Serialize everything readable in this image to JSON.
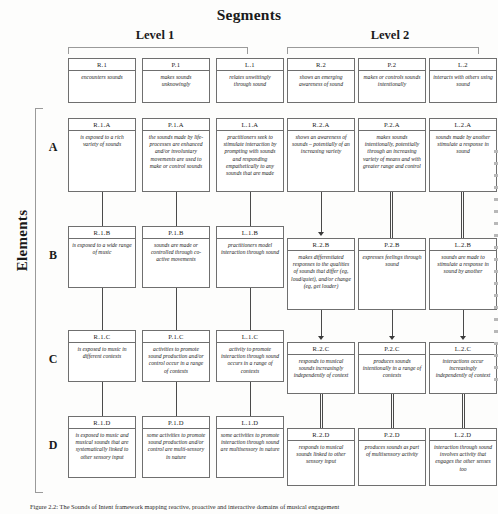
{
  "titles": {
    "segments": "Segments",
    "level1": "Level 1",
    "level2": "Level 2",
    "elements": "Elements"
  },
  "caption": "Figure 2.2: The Sounds of Intent framework mapping reactive, proactive and interactive domains of musical engagement",
  "row_letters": [
    "A",
    "B",
    "C",
    "D"
  ],
  "header_boxes": [
    {
      "code": "R.1",
      "text": "encounters sounds"
    },
    {
      "code": "P.1",
      "text": "makes sounds unknowingly"
    },
    {
      "code": "L.1",
      "text": "relates unwittingly through sound"
    },
    {
      "code": "R.2",
      "text": "shows an emerging awareness of sound"
    },
    {
      "code": "P.2",
      "text": "makes or controls sounds intentionally"
    },
    {
      "code": "L.2",
      "text": "interacts with others using sound"
    }
  ],
  "cells": {
    "A": [
      {
        "code": "R.1.A",
        "text": "is exposed to a rich variety of sounds"
      },
      {
        "code": "P.1.A",
        "text": "the sounds made by life-processes are enhanced and/or involuntary movements are used to make or control sounds"
      },
      {
        "code": "L.1.A",
        "text": "practitioners seek to stimulate interaction by prompting with sounds and responding empathetically to any sounds that are made"
      },
      {
        "code": "R.2.A",
        "text": "shows an awareness of sounds – potentially of an increasing variety"
      },
      {
        "code": "P.2.A",
        "text": "makes sounds intentionally, potentially through an increasing variety of means and with greater range and control"
      },
      {
        "code": "L.2.A",
        "text": "sounds made by another stimulate a response in sound"
      }
    ],
    "B": [
      {
        "code": "R.1.B",
        "text": "is exposed to a wide range of music"
      },
      {
        "code": "P.1.B",
        "text": "sounds are made or controlled through co-active movements"
      },
      {
        "code": "L.1.B",
        "text": "practitioners model interaction through sound"
      },
      {
        "code": "R.2.B",
        "text": "makes differentiated responses to the qualities of sounds that differ (eg, loud/quiet), and/or change (eg, get louder)"
      },
      {
        "code": "P.2.B",
        "text": "expresses feelings through sound"
      },
      {
        "code": "L.2.B",
        "text": "sounds are made to stimulate a response in sound by another"
      }
    ],
    "C": [
      {
        "code": "R.1.C",
        "text": "is exposed to music in different contexts"
      },
      {
        "code": "P.1.C",
        "text": "activities to promote sound production and/or control occur in a range of contexts"
      },
      {
        "code": "L.1.C",
        "text": "activity to promote interaction through sound occurs in a range of contexts"
      },
      {
        "code": "R.2.C",
        "text": "responds to musical sounds increasingly independently of context"
      },
      {
        "code": "P.2.C",
        "text": "produces sounds intentionally in a range of contexts"
      },
      {
        "code": "L.2.C",
        "text": "interactions occur increasingly independently of context"
      }
    ],
    "D": [
      {
        "code": "R.1.D",
        "text": "is exposed to music and musical sounds that are systematically linked to other sensory input"
      },
      {
        "code": "P.1.D",
        "text": "some activities to promote sound production and/or control are multi-sensory in nature"
      },
      {
        "code": "L.1.D",
        "text": "some activities to promote interaction through sound are multisensory in nature"
      },
      {
        "code": "R.2.D",
        "text": "responds to musical sounds linked to other sensory input"
      },
      {
        "code": "P.2.D",
        "text": "produces sounds as part of multisensory activity"
      },
      {
        "code": "L.2.D",
        "text": "interaction through sound involves activity that engages the other senses too"
      }
    ]
  }
}
